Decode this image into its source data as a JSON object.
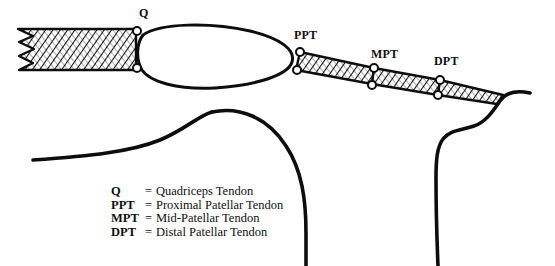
{
  "figure": {
    "width": 555,
    "height": 266,
    "background_color": "#ffffff",
    "ink_color": "#0d0d0d"
  },
  "markers": [
    {
      "id": "q",
      "label": "Q",
      "x": 139,
      "y": 6,
      "node_name": "marker-label-q"
    },
    {
      "id": "ppt",
      "label": "PPT",
      "x": 294,
      "y": 28,
      "node_name": "marker-label-ppt"
    },
    {
      "id": "mpt",
      "label": "MPT",
      "x": 371,
      "y": 47,
      "node_name": "marker-label-mpt"
    },
    {
      "id": "dpt",
      "label": "DPT",
      "x": 434,
      "y": 54,
      "node_name": "marker-label-dpt"
    }
  ],
  "legend": {
    "rows": [
      {
        "abbr": "Q",
        "eq": "=",
        "term": "Quadriceps Tendon"
      },
      {
        "abbr": "PPT",
        "eq": "=",
        "term": "Proximal Patellar Tendon"
      },
      {
        "abbr": "MPT",
        "eq": "=",
        "term": "Mid-Patellar Tendon"
      },
      {
        "abbr": "DPT",
        "eq": "=",
        "term": "Distal Patellar Tendon"
      }
    ]
  },
  "structures": [
    {
      "name": "quadriceps-tendon-band",
      "label": "Quadriceps Tendon",
      "fill": "hatched",
      "torn_end": "left"
    },
    {
      "name": "patella-outline",
      "label": "Patella",
      "fill": "white"
    },
    {
      "name": "proximal-patellar-tendon-segment",
      "label": "Proximal Patellar Tendon",
      "fill": "hatched"
    },
    {
      "name": "mid-patellar-tendon-segment",
      "label": "Mid-Patellar Tendon",
      "fill": "hatched"
    },
    {
      "name": "distal-patellar-tendon-segment",
      "label": "Distal Patellar Tendon",
      "fill": "hatched"
    },
    {
      "name": "femur-outline",
      "label": "Femur",
      "fill": "none"
    },
    {
      "name": "tibia-outline",
      "label": "Tibia",
      "fill": "none"
    }
  ]
}
